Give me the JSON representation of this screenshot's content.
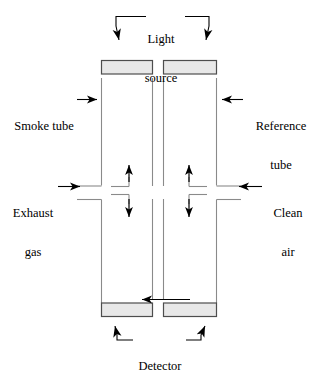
{
  "diagram": {
    "style": {
      "line_color": "#000000",
      "box_fill": "#e8e8e8",
      "box_stroke": "#4d4d4d",
      "background": "#ffffff"
    },
    "labels": {
      "light_source": {
        "line1": "Light",
        "line2": "source"
      },
      "smoke_tube": {
        "line1": "Smoke tube"
      },
      "reference_tube": {
        "line1": "Reference",
        "line2": "tube"
      },
      "exhaust_gas": {
        "line1": "Exhaust",
        "line2": "gas"
      },
      "clean_air": {
        "line1": "Clean",
        "line2": "air"
      },
      "detector": {
        "line1": "Detector"
      }
    },
    "components": [
      {
        "name": "light-source-box-left",
        "role": "light source emitter over smoke tube"
      },
      {
        "name": "light-source-box-right",
        "role": "light source emitter over reference tube"
      },
      {
        "name": "detector-box-left",
        "role": "detector under smoke tube"
      },
      {
        "name": "detector-box-right",
        "role": "detector under reference tube"
      },
      {
        "name": "smoke-tube",
        "role": "left vertical tube carrying exhaust gas"
      },
      {
        "name": "reference-tube",
        "role": "right vertical tube carrying clean air"
      }
    ],
    "flows": [
      {
        "name": "exhaust-gas-inlet",
        "direction": "right",
        "side": "left"
      },
      {
        "name": "clean-air-inlet",
        "direction": "left",
        "side": "right"
      },
      {
        "name": "smoke-tube-up-flow",
        "direction": "up",
        "side": "left"
      },
      {
        "name": "smoke-tube-down-flow",
        "direction": "down",
        "side": "left"
      },
      {
        "name": "reference-tube-up-flow",
        "direction": "up",
        "side": "right"
      },
      {
        "name": "reference-tube-down-flow",
        "direction": "down",
        "side": "right"
      },
      {
        "name": "detector-beam-arrow",
        "direction": "left",
        "side": "center"
      }
    ]
  }
}
